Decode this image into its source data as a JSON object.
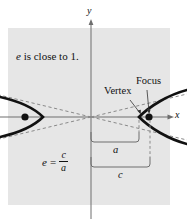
{
  "figure": {
    "type": "hyperbola-eccentricity-diagram",
    "background_color": "#ffffff",
    "plot_panel_color": "#e6e6e6",
    "ink_color": "#111111",
    "axis_color": "#6e6e6e",
    "dashed_color": "#8a8a8a",
    "panel": {
      "x": 8,
      "y": 28,
      "width": 162,
      "height": 177
    },
    "axes": {
      "x_label": "x",
      "y_label": "y",
      "origin": {
        "x": 91,
        "y": 117
      },
      "x_axis_y": 117,
      "y_axis_x": 91
    },
    "annotations": {
      "eccentricity_note_var": "e",
      "eccentricity_note_text": "is close to 1.",
      "vertex_label": "Vertex",
      "focus_label": "Focus",
      "segment_a_label": "a",
      "segment_c_label": "c"
    },
    "formula": {
      "lhs": "e",
      "equals": "=",
      "numerator": "c",
      "denominator": "a"
    },
    "geometry": {
      "center_x": 91,
      "vertex_right_x": 139,
      "focus_right_x": 149,
      "vertex_left_x": 43,
      "focus_left_x": 25,
      "focus_dot_radius": 3.4,
      "bracket_a": {
        "left": 91,
        "right": 139,
        "top": 133,
        "bottom": 143
      },
      "bracket_c": {
        "left": 91,
        "right": 150,
        "top": 158,
        "bottom": 168
      }
    }
  }
}
